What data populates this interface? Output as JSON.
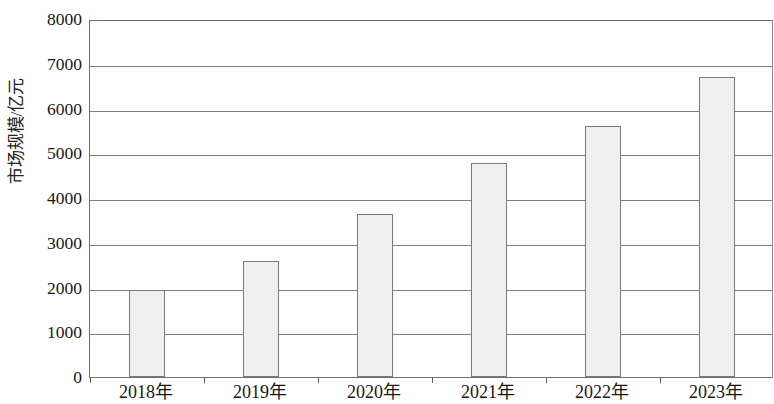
{
  "chart_data": {
    "type": "bar",
    "title": "",
    "subtitle": "",
    "xlabel": "",
    "ylabel": "市场规模/亿元",
    "categories": [
      "2018年",
      "2019年",
      "2020年",
      "2021年",
      "2022年",
      "2023年"
    ],
    "values": [
      1950,
      2600,
      3650,
      4780,
      5600,
      6700
    ],
    "series": [
      {
        "name": "市场规模",
        "values": [
          1950,
          2600,
          3650,
          4780,
          5600,
          6700
        ]
      }
    ],
    "ylim": [
      0,
      8000
    ],
    "y_ticks": [
      0,
      1000,
      2000,
      3000,
      4000,
      5000,
      6000,
      7000,
      8000
    ],
    "y_tick_labels": [
      "0",
      "1000",
      "2000",
      "3000",
      "4000",
      "5000",
      "6000",
      "7000",
      "8000"
    ],
    "grid": "horizontal",
    "legend": "none",
    "bar_fill_color": "#efefef",
    "bar_border_color": "#7a7a7a",
    "axis_color": "#6f6f6f",
    "gridline_color": "#7d7d7d",
    "background_color": "#ffffff",
    "annotations": []
  }
}
